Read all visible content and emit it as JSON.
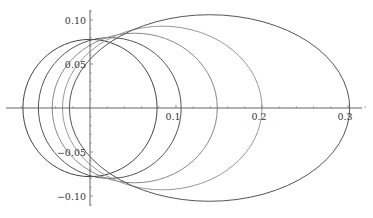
{
  "chart_data": {
    "type": "line",
    "title": "",
    "xlabel": "",
    "ylabel": "",
    "xlim": [
      -0.1,
      0.32
    ],
    "ylim": [
      -0.12,
      0.12
    ],
    "grid": false,
    "legend": null,
    "x_ticks": [
      {
        "value": 0.1,
        "label": "0.1"
      },
      {
        "value": 0.2,
        "label": "0.2"
      },
      {
        "value": 0.3,
        "label": "0.3"
      }
    ],
    "y_ticks": [
      {
        "value": 0.1,
        "label": "0.10"
      },
      {
        "value": 0.05,
        "label": "0.05"
      },
      {
        "value": -0.05,
        "label": "−0.05"
      },
      {
        "value": -0.1,
        "label": "−0.10"
      }
    ],
    "series": [
      {
        "name": "ellipse 1",
        "shape": "ellipse",
        "cx": 0.0,
        "cy": 0,
        "rx": 0.078,
        "ry": 0.078,
        "color": "#444444"
      },
      {
        "name": "ellipse 2",
        "shape": "ellipse",
        "cx": 0.023,
        "cy": 0,
        "rx": 0.083,
        "ry": 0.08,
        "color": "#555555"
      },
      {
        "name": "ellipse 3",
        "shape": "ellipse",
        "cx": 0.052,
        "cy": 0,
        "rx": 0.096,
        "ry": 0.085,
        "color": "#888888"
      },
      {
        "name": "ellipse 4",
        "shape": "ellipse",
        "cx": 0.084,
        "cy": 0,
        "rx": 0.116,
        "ry": 0.093,
        "color": "#999999"
      },
      {
        "name": "ellipse 5",
        "shape": "ellipse",
        "cx": 0.139,
        "cy": 0,
        "rx": 0.163,
        "ry": 0.106,
        "color": "#555555"
      }
    ]
  },
  "layout": {
    "origin_px": [
      90,
      108
    ],
    "x_scale_px_per_unit": 860,
    "y_scale_px_per_unit": 880
  }
}
